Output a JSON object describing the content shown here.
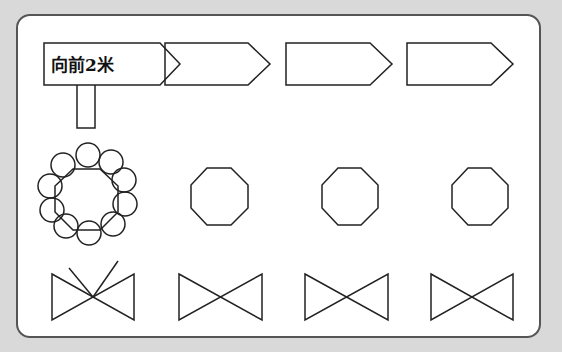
{
  "diagram": {
    "background_color": "#d9d9d9",
    "panel_color": "#ffffff",
    "stroke_color": "#222222",
    "rows": [
      {
        "name": "signposts",
        "items": [
          {
            "shape": "arrow-sign-with-post",
            "label": "向前2米"
          },
          {
            "shape": "arrow-sign",
            "label": ""
          },
          {
            "shape": "arrow-sign",
            "label": ""
          },
          {
            "shape": "arrow-sign",
            "label": ""
          }
        ]
      },
      {
        "name": "octagons",
        "items": [
          {
            "shape": "octagon-with-circles",
            "circle_count": 10
          },
          {
            "shape": "octagon"
          },
          {
            "shape": "octagon"
          },
          {
            "shape": "octagon"
          }
        ]
      },
      {
        "name": "bowties",
        "items": [
          {
            "shape": "bowtie-with-extra-lines"
          },
          {
            "shape": "bowtie"
          },
          {
            "shape": "bowtie"
          },
          {
            "shape": "bowtie"
          }
        ]
      }
    ]
  }
}
